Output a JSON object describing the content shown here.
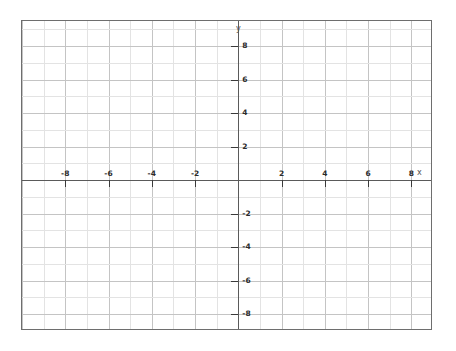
{
  "chart_data": {
    "type": "scatter",
    "title": "",
    "subtitle": "",
    "xlabel": "x",
    "ylabel": "y",
    "xlim": [
      -10,
      9
    ],
    "ylim": [
      -9,
      9.5
    ],
    "grid": true,
    "minor_grid": true,
    "major_grid_interval": 2,
    "minor_grid_interval": 1,
    "legend": null,
    "series": [],
    "values": [],
    "x": [],
    "categories": [],
    "annotations": [],
    "x_tick_values": [
      -8,
      -6,
      -4,
      -2,
      2,
      4,
      6,
      8
    ],
    "y_tick_values": [
      8,
      6,
      4,
      2,
      -2,
      -4,
      -6,
      -8
    ],
    "x_tick_labels": [
      "-8",
      "-6",
      "-4",
      "-2",
      "2",
      "4",
      "6",
      "8"
    ],
    "y_tick_labels": [
      "8",
      "6",
      "4",
      "2",
      "-2",
      "-4",
      "-6",
      "-8"
    ],
    "colors": {
      "background": "#ffffff",
      "border": "#6e6e6e",
      "axis": "#5a5a5a",
      "tick": "#3a3a3a",
      "grid_minor": "#e3e3e3",
      "grid_major": "#c4c4c4",
      "label_text": "#2b2b2b",
      "axis_name_text": "#555555"
    }
  },
  "axes": {
    "x_name": "x",
    "y_name": "y"
  },
  "x_ticks": [
    {
      "value": -8,
      "label": "-8"
    },
    {
      "value": -6,
      "label": "-6"
    },
    {
      "value": -4,
      "label": "-4"
    },
    {
      "value": -2,
      "label": "-2"
    },
    {
      "value": 2,
      "label": "2"
    },
    {
      "value": 4,
      "label": "4"
    },
    {
      "value": 6,
      "label": "6"
    },
    {
      "value": 8,
      "label": "8"
    }
  ],
  "y_ticks": [
    {
      "value": 8,
      "label": "8"
    },
    {
      "value": 6,
      "label": "6"
    },
    {
      "value": 4,
      "label": "4"
    },
    {
      "value": 2,
      "label": "2"
    },
    {
      "value": -2,
      "label": "-2"
    },
    {
      "value": -4,
      "label": "-4"
    },
    {
      "value": -6,
      "label": "-6"
    },
    {
      "value": -8,
      "label": "-8"
    }
  ]
}
